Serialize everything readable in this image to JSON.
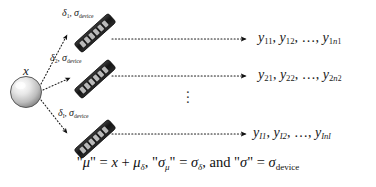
{
  "figure": {
    "kind": "measurement-uncertainty-diagram",
    "background_color": "#ffffff",
    "ink_color": "#111111",
    "source_label": "x",
    "vertical_ellipsis": "⋮"
  },
  "source": {
    "name": "sphere-source",
    "label": "x",
    "fill_light": "#fdfdfd",
    "fill_dark": "#8e8e8e",
    "stroke": "#555555"
  },
  "devices": [
    {
      "id": 1,
      "delta": "δ",
      "delta_sub": "1",
      "sigma": "σ",
      "sigma_sub": "device",
      "separator": ", ",
      "body_color": "#1b1b1b"
    },
    {
      "id": 2,
      "delta": "δ",
      "delta_sub": "2",
      "sigma": "σ",
      "sigma_sub": "device",
      "separator": ", ",
      "body_color": "#1b1b1b"
    },
    {
      "id": 3,
      "delta": "δ",
      "delta_sub": "I",
      "sigma": "σ",
      "sigma_sub": "device",
      "separator": ", ",
      "body_color": "#1b1b1b"
    }
  ],
  "outputs": [
    {
      "row": 1,
      "y": "y",
      "first_sub": "11",
      "second_sub": "12",
      "ellipsis": "…",
      "last_sub_prefix": "1",
      "last_sub_n": "n",
      "last_sub_n_sub": "1",
      "sep": ", "
    },
    {
      "row": 2,
      "y": "y",
      "first_sub": "21",
      "second_sub": "22",
      "ellipsis": "…",
      "last_sub_prefix": "2",
      "last_sub_n": "n",
      "last_sub_n_sub": "2",
      "sep": ", "
    },
    {
      "row": 3,
      "y": "y",
      "first_sub": "I1",
      "second_sub": "I2",
      "ellipsis": "…",
      "last_sub_prefix": "I",
      "last_sub_n": "n",
      "last_sub_n_sub": "I",
      "sep": ", "
    }
  ],
  "equation": {
    "full_text": "\"μ\" = x + μδ, \"σμ\" = σδ, and \"σ\" = σdevice",
    "p1_quote_open": "\"",
    "p1_mu": "μ",
    "p1_quote_close": "\"",
    "p1_eq": " = ",
    "p1_x": "x",
    "p1_plus": " + ",
    "p1_mu2": "μ",
    "p1_mu2_sub": "δ",
    "p1_comma": ", ",
    "p2_quote_open": "\"",
    "p2_sigma": "σ",
    "p2_sigma_sub": "μ",
    "p2_quote_close": "\"",
    "p2_eq": " = ",
    "p2_sigma2": "σ",
    "p2_sigma2_sub": "δ",
    "p2_comma": ", ",
    "p3_and": "and ",
    "p3_quote_open": "\"",
    "p3_sigma": "σ",
    "p3_quote_close": "\"",
    "p3_eq": " = ",
    "p3_sigma2": "σ",
    "p3_sigma2_sub": "device"
  }
}
